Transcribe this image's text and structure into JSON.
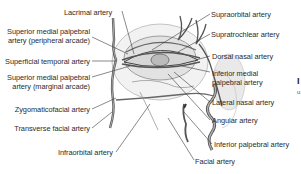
{
  "diagram": {
    "labels_left": [
      {
        "id": "lacrimal",
        "text": "Lacrimal artery"
      },
      {
        "id": "sup-med-palp-peripheral-1",
        "text": "Superior medial palpebral"
      },
      {
        "id": "sup-med-palp-peripheral-2",
        "text": "artery (peripheral arcade)"
      },
      {
        "id": "superficial-temporal",
        "text": "Superficial temporal artery"
      },
      {
        "id": "sup-med-palp-marginal-1",
        "text": "Superior medial palpebral"
      },
      {
        "id": "sup-med-palp-marginal-2",
        "text": "artery (marginal arcade)"
      },
      {
        "id": "zygomaticofacial",
        "text": "Zygomaticofacial artery"
      },
      {
        "id": "transverse-facial",
        "text": "Transverse facial artery"
      },
      {
        "id": "infraorbital",
        "text": "Infraorbital artery"
      }
    ],
    "labels_right": [
      {
        "id": "supraorbital",
        "text": "Supraorbital artery"
      },
      {
        "id": "supratrochlear",
        "text": "Supratrochlear artery"
      },
      {
        "id": "dorsal-nasal",
        "text": "Dorsal nasal artery"
      },
      {
        "id": "inf-med-palp-1",
        "text": "Inferior medial"
      },
      {
        "id": "inf-med-palp-2",
        "text": "palpebral artery"
      },
      {
        "id": "lateral-nasal",
        "text": "Lateral nasal artery"
      },
      {
        "id": "angular",
        "text": "Angular artery"
      },
      {
        "id": "inferior-palpebral",
        "text": "Inferior palpebral artery"
      },
      {
        "id": "facial",
        "text": "Facial artery"
      }
    ],
    "edge_fragment": {
      "char1": "I",
      "char2": "u"
    },
    "colors": {
      "line": "#3a3a3a",
      "vessel": "#555555",
      "vessel_fill": "#9a9a9a",
      "skin": "#e6e6e6",
      "text": "#2b2b2b"
    }
  }
}
